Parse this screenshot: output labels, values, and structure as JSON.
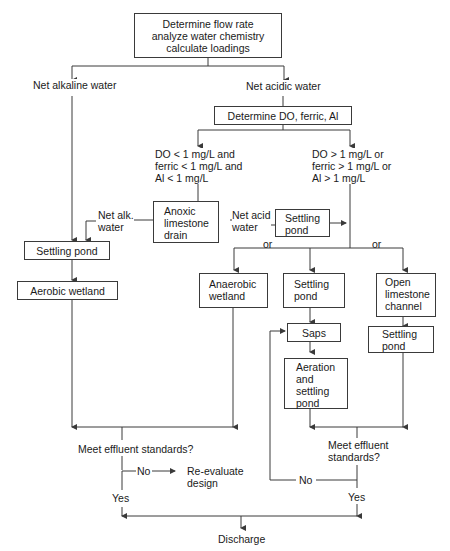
{
  "diagram": {
    "type": "flowchart",
    "boxes": {
      "start": "Determine flow rate\nanalyze water chemistry\ncalculate loadings",
      "determine_do": "Determine DO, ferric, Al",
      "anoxic_drain": "Anoxic\nlimestone\ndrain",
      "settling_pond_acid": "Settling\npond",
      "settling_pond_alk": "Settling pond",
      "aerobic_wetland": "Aerobic wetland",
      "anaerobic_wetland": "Anaerobic\nwetland",
      "settling_pond_mid": "Settling\npond",
      "open_limestone": "Open\nlimestone\nchannel",
      "saps": "Saps",
      "settling_pond_right": "Settling\npond",
      "aeration_settling": "Aeration\nand\nsettling\npond"
    },
    "labels": {
      "net_alkaline": "Net alkaline water",
      "net_acidic": "Net acidic water",
      "low_metals": "DO < 1 mg/L and\nferric < 1 mg/L and\nAl < 1 mg/L",
      "high_metals": "DO > 1 mg/L or\nferric > 1 mg/L or\nAl > 1 mg/L",
      "net_alk_short": "Net alk.\nwater",
      "net_acid_short": "Net acid\nwater",
      "or_left": "or",
      "or_right": "or",
      "meet_left": "Meet effluent standards?",
      "no_left": "No",
      "reevaluate": "Re-evaluate\ndesign",
      "yes_left": "Yes",
      "meet_right": "Meet effluent\nstandards?",
      "no_right": "No",
      "yes_right": "Yes",
      "discharge": "Discharge"
    },
    "colors": {
      "line": "#3a3a3a",
      "text": "#1a1a1a",
      "background": "#ffffff"
    }
  }
}
